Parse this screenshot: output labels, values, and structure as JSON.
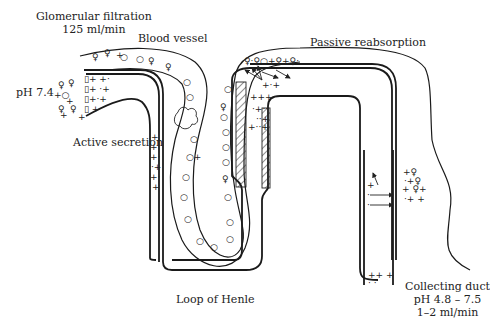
{
  "labels": {
    "glomerular_filtration": "Glomerular filtration",
    "glomerular_rate": "125 ml/min",
    "blood_vessel": "Blood vessel",
    "passive_reabsorption": "Passive reabsorption",
    "ph_blood": "pH 7.4",
    "active_secretion": "Active secretion",
    "loop_of_henle": "Loop of Henle",
    "collecting_duct": "Collecting duct",
    "ph_urine": "pH 4.8 – 7.5",
    "urine_rate": "1–2 ml/min"
  },
  "legend_symbols": {
    "plus": "+",
    "female_sign": "♀",
    "circle": "○",
    "dot": "•"
  },
  "colors": {
    "line": "#1a1a1a",
    "background": "#ffffff"
  }
}
